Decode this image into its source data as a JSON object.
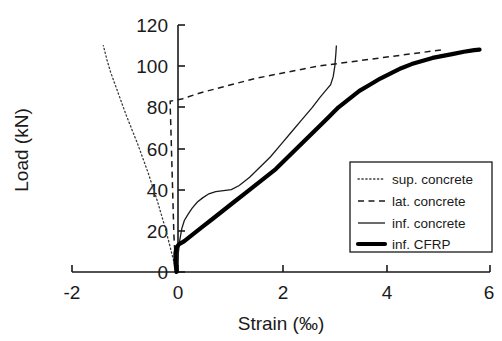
{
  "chart_data": {
    "type": "line",
    "title": "",
    "xlabel": "Strain (‰)",
    "ylabel": "Load (kN)",
    "xlim": [
      -2,
      6
    ],
    "ylim": [
      0,
      120
    ],
    "xticks": [
      -2,
      0,
      2,
      4,
      6
    ],
    "xtick_labels": [
      "-2",
      "0",
      "2",
      "4",
      "6"
    ],
    "yticks": [
      0,
      20,
      40,
      60,
      80,
      100,
      120
    ],
    "ytick_labels": [
      "0",
      "20",
      "40",
      "60",
      "80",
      "100",
      "120"
    ],
    "grid": false,
    "legend_position": "lower-right",
    "series": [
      {
        "name": "sup. concrete",
        "style": "dotted",
        "points": [
          [
            0,
            0
          ],
          [
            -0.06,
            6
          ],
          [
            -0.13,
            13
          ],
          [
            -0.2,
            20
          ],
          [
            -0.28,
            27
          ],
          [
            -0.36,
            34
          ],
          [
            -0.45,
            41
          ],
          [
            -0.54,
            48
          ],
          [
            -0.64,
            55
          ],
          [
            -0.74,
            62
          ],
          [
            -0.85,
            69
          ],
          [
            -0.96,
            76
          ],
          [
            -1.06,
            83
          ],
          [
            -1.16,
            90
          ],
          [
            -1.26,
            97
          ],
          [
            -1.33,
            103
          ],
          [
            -1.4,
            110
          ]
        ]
      },
      {
        "name": "lat. concrete",
        "style": "dashed",
        "points": [
          [
            0,
            0
          ],
          [
            -0.03,
            9
          ],
          [
            -0.05,
            18
          ],
          [
            -0.06,
            27
          ],
          [
            -0.07,
            36
          ],
          [
            -0.08,
            45
          ],
          [
            -0.09,
            54
          ],
          [
            -0.1,
            63
          ],
          [
            -0.11,
            72
          ],
          [
            -0.12,
            80
          ],
          [
            -0.12,
            83
          ],
          [
            0.1,
            84
          ],
          [
            0.45,
            87
          ],
          [
            0.9,
            90
          ],
          [
            1.5,
            94
          ],
          [
            2.1,
            97
          ],
          [
            2.7,
            100
          ],
          [
            3.3,
            102
          ],
          [
            3.9,
            104
          ],
          [
            4.5,
            106
          ],
          [
            5.1,
            108
          ]
        ]
      },
      {
        "name": "inf. concrete",
        "style": "solid-thin",
        "points": [
          [
            0,
            0
          ],
          [
            0.03,
            8
          ],
          [
            0.06,
            15
          ],
          [
            0.1,
            21
          ],
          [
            0.15,
            25
          ],
          [
            0.22,
            28
          ],
          [
            0.3,
            31
          ],
          [
            0.4,
            34
          ],
          [
            0.5,
            36
          ],
          [
            0.62,
            38
          ],
          [
            0.75,
            39
          ],
          [
            0.9,
            39.5
          ],
          [
            1.05,
            40
          ],
          [
            1.2,
            42
          ],
          [
            1.4,
            46
          ],
          [
            1.6,
            51
          ],
          [
            1.8,
            56
          ],
          [
            2.0,
            62
          ],
          [
            2.2,
            68
          ],
          [
            2.4,
            74
          ],
          [
            2.6,
            80
          ],
          [
            2.75,
            85
          ],
          [
            2.85,
            88
          ],
          [
            2.95,
            91
          ],
          [
            3.0,
            95
          ],
          [
            3.03,
            100
          ],
          [
            3.05,
            106
          ],
          [
            3.06,
            110
          ]
        ]
      },
      {
        "name": "inf. CFRP",
        "style": "solid-thick",
        "points": [
          [
            0,
            0
          ],
          [
            -0.02,
            5
          ],
          [
            -0.02,
            9
          ],
          [
            0.0,
            12
          ],
          [
            0.05,
            13.5
          ],
          [
            0.15,
            15
          ],
          [
            0.3,
            18
          ],
          [
            0.5,
            22
          ],
          [
            0.7,
            26
          ],
          [
            0.9,
            30
          ],
          [
            1.1,
            34
          ],
          [
            1.3,
            38
          ],
          [
            1.5,
            42
          ],
          [
            1.7,
            46
          ],
          [
            1.9,
            50
          ],
          [
            2.1,
            55
          ],
          [
            2.3,
            60
          ],
          [
            2.5,
            65
          ],
          [
            2.7,
            70
          ],
          [
            2.9,
            75
          ],
          [
            3.1,
            80
          ],
          [
            3.3,
            84
          ],
          [
            3.5,
            88
          ],
          [
            3.7,
            91
          ],
          [
            3.9,
            94
          ],
          [
            4.1,
            96.5
          ],
          [
            4.3,
            99
          ],
          [
            4.5,
            101
          ],
          [
            4.7,
            102.5
          ],
          [
            4.9,
            104
          ],
          [
            5.1,
            105
          ],
          [
            5.3,
            106
          ],
          [
            5.5,
            107
          ],
          [
            5.7,
            107.8
          ],
          [
            5.8,
            108
          ]
        ]
      }
    ],
    "legend": [
      {
        "label": "sup. concrete",
        "style": "dotted"
      },
      {
        "label": "lat. concrete",
        "style": "dashed"
      },
      {
        "label": "inf. concrete",
        "style": "solid-thin"
      },
      {
        "label": "inf. CFRP",
        "style": "solid-thick"
      }
    ]
  }
}
